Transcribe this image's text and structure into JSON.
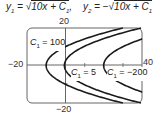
{
  "equations": {
    "y1": {
      "lhs": "y",
      "sub": "1",
      "rhs_expr": "10x + C",
      "rhs_sub": "1",
      "sign": ""
    },
    "y2": {
      "lhs": "y",
      "sub": "2",
      "rhs_expr": "10x + C",
      "rhs_sub": "1",
      "sign": "−"
    }
  },
  "chart_data": {
    "type": "line",
    "xlabel": "",
    "ylabel": "",
    "xlim": [
      -20,
      40
    ],
    "ylim": [
      -20,
      20
    ],
    "tick_labels": {
      "x_min": "−20",
      "x_max": "40",
      "y_max": "20",
      "y_min": "−20"
    },
    "grid": false,
    "series": [
      {
        "name": "C1 = 100",
        "label": "= 100",
        "C1": 100,
        "vertex_x": -10
      },
      {
        "name": "C1 = 5",
        "label": "= 5",
        "C1": 5,
        "vertex_x": -0.5
      },
      {
        "name": "C1 = −200",
        "label": "= −200",
        "C1": -200,
        "vertex_x": 20
      }
    ]
  },
  "colors": {
    "curve": "#1a1a1a",
    "axis": "#555555",
    "frame": "#555555"
  }
}
